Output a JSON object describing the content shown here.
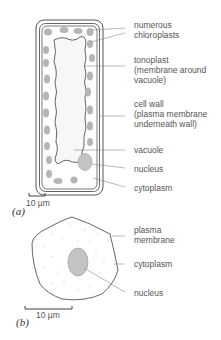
{
  "panels": {
    "a": {
      "letter": "(a)",
      "scale_bar": "10 µm",
      "labels": {
        "chloroplasts": "numerous\nchloroplasts",
        "tonoplast": "tonoplast\n(membrane around\nvacuole)",
        "cell_wall": "cell wall\n(plasma membrane\nunderneath wall)",
        "vacuole": "vacuole",
        "nucleus": "nucleus",
        "cytoplasm": "cytoplasm"
      }
    },
    "b": {
      "letter": "(b)",
      "scale_bar": "10 µm",
      "labels": {
        "plasma_membrane": "plasma\nmembrane",
        "cytoplasm": "cytoplasm",
        "nucleus": "nucleus"
      }
    }
  },
  "colors": {
    "outline": "#555555",
    "chloroplast": "#b5b5b5",
    "nucleus": "#c4c4c4",
    "vacuole": "#f7f7f7",
    "leader": "#8a8a8a"
  }
}
